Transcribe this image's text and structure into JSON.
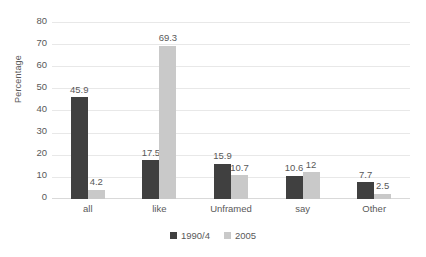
{
  "chart_data": {
    "type": "bar",
    "title": "",
    "xlabel": "",
    "ylabel": "Percentage",
    "ylim": [
      0,
      80
    ],
    "ytick_step": 10,
    "yticks": [
      "80",
      "70",
      "60",
      "50",
      "40",
      "30",
      "20",
      "10",
      "0"
    ],
    "grid": true,
    "legend_position": "bottom",
    "categories": [
      "all",
      "like",
      "Unframed",
      "say",
      "Other"
    ],
    "series": [
      {
        "name": "1990/4",
        "color": "#404040",
        "values": [
          45.9,
          17.5,
          15.9,
          10.6,
          7.7
        ],
        "labels": [
          "45.9",
          "17.5",
          "15.9",
          "10.6",
          "7.7"
        ]
      },
      {
        "name": "2005",
        "color": "#c9c9c9",
        "values": [
          4.2,
          69.3,
          10.7,
          12,
          2.5
        ],
        "labels": [
          "4.2",
          "69.3",
          "10.7",
          "12",
          "2.5"
        ]
      }
    ]
  },
  "colors": {
    "series_1990": "#404040",
    "series_2005": "#c9c9c9",
    "gridline": "#e8e8e8",
    "text": "#595959",
    "background": "#ffffff"
  }
}
